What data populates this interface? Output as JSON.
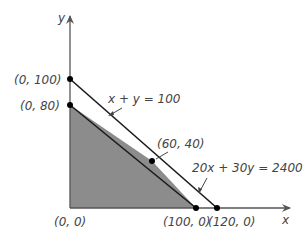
{
  "diagram": {
    "type": "linear-programming-feasible-region",
    "axes": {
      "x_label": "x",
      "y_label": "y"
    },
    "lines": [
      {
        "equation": "x + y = 100",
        "label": "x + y = 100",
        "endpoints": [
          [
            0,
            100
          ],
          [
            120,
            0
          ]
        ]
      },
      {
        "equation": "20x + 30y = 2400",
        "label": "20x + 30y = 2400",
        "endpoints": [
          [
            0,
            80
          ],
          [
            100,
            0
          ]
        ]
      }
    ],
    "points": [
      {
        "coords": "(0, 0)",
        "label": "(0, 0)"
      },
      {
        "coords": "(0, 80)",
        "label": "(0, 80)"
      },
      {
        "coords": "(0, 100)",
        "label": "(0, 100)"
      },
      {
        "coords": "(60, 40)",
        "label": "(60, 40)"
      },
      {
        "coords": "(100, 0)",
        "label": "(100, 0)"
      },
      {
        "coords": "(120, 0)",
        "label": "(120, 0)"
      }
    ],
    "feasible_region": {
      "vertices": [
        "(0, 0)",
        "(0, 80)",
        "(60, 40)",
        "(100, 0)"
      ],
      "fill_color": "#8c8c8c"
    },
    "colors": {
      "axis": "#555555",
      "line": "#1a1a1a",
      "point": "#000000",
      "text": "#444444"
    }
  }
}
